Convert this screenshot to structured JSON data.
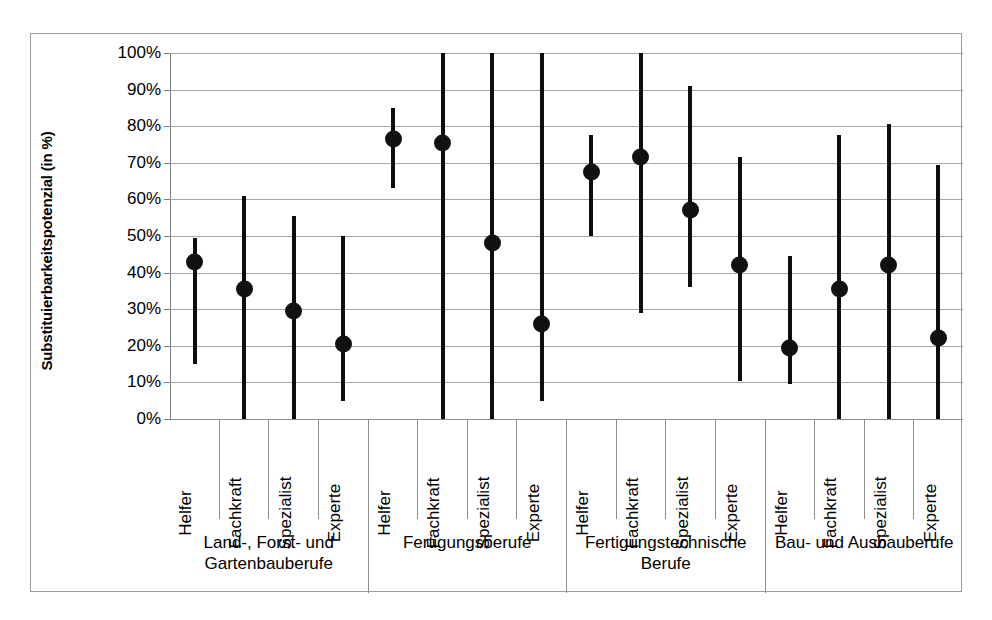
{
  "chart_data": {
    "type": "scatter",
    "title": "",
    "xlabel": "",
    "ylabel": "Substituierbarkeitspotenzial (in %)",
    "ylim": [
      0,
      100
    ],
    "ytick_labels": [
      "0%",
      "10%",
      "20%",
      "30%",
      "40%",
      "50%",
      "60%",
      "70%",
      "80%",
      "90%",
      "100%"
    ],
    "ytick_values": [
      0,
      10,
      20,
      30,
      40,
      50,
      60,
      70,
      80,
      90,
      100
    ],
    "grid": true,
    "legend": "none",
    "marker_color": "#111111",
    "whisker_color": "#0d0d0d",
    "groups": [
      {
        "name": "Land-, Forst- und Gartenbauberufe",
        "categories": [
          {
            "label": "Helfer",
            "value": 43.0,
            "low": 15.0,
            "high": 49.5
          },
          {
            "label": "Fachkraft",
            "value": 35.5,
            "low": 0.0,
            "high": 61.0
          },
          {
            "label": "Spezialist",
            "value": 29.5,
            "low": 0.0,
            "high": 55.5
          },
          {
            "label": "Experte",
            "value": 20.5,
            "low": 5.0,
            "high": 50.0
          }
        ]
      },
      {
        "name": "Fertigungsberufe",
        "categories": [
          {
            "label": "Helfer",
            "value": 76.5,
            "low": 63.0,
            "high": 85.0
          },
          {
            "label": "Fachkraft",
            "value": 75.5,
            "low": 0.0,
            "high": 100.0
          },
          {
            "label": "Spezialist",
            "value": 48.0,
            "low": 0.0,
            "high": 100.0
          },
          {
            "label": "Experte",
            "value": 26.0,
            "low": 5.0,
            "high": 100.0
          }
        ]
      },
      {
        "name": "Fertigungstechnische Berufe",
        "categories": [
          {
            "label": "Helfer",
            "value": 67.5,
            "low": 50.0,
            "high": 77.5
          },
          {
            "label": "Fachkraft",
            "value": 71.5,
            "low": 29.0,
            "high": 100.0
          },
          {
            "label": "Spezialist",
            "value": 57.0,
            "low": 36.0,
            "high": 91.0
          },
          {
            "label": "Experte",
            "value": 42.0,
            "low": 10.5,
            "high": 71.5
          }
        ]
      },
      {
        "name": "Bau- und Ausbauberufe",
        "categories": [
          {
            "label": "Helfer",
            "value": 19.5,
            "low": 9.5,
            "high": 44.5
          },
          {
            "label": "Fachkraft",
            "value": 35.5,
            "low": 0.0,
            "high": 77.5
          },
          {
            "label": "Spezialist",
            "value": 42.0,
            "low": 0.0,
            "high": 80.5
          },
          {
            "label": "Experte",
            "value": 22.0,
            "low": 0.0,
            "high": 69.5
          }
        ]
      }
    ]
  }
}
